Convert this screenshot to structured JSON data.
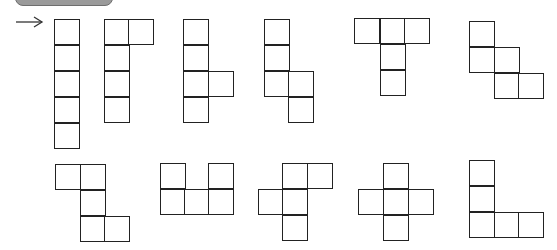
{
  "header": {
    "label": ""
  },
  "arrow": {
    "icon": "right-arrow-icon",
    "glyph": "→"
  },
  "cell_size": 25,
  "shapes": [
    {
      "id": "net-1",
      "cells": [
        [
          54,
          19
        ],
        [
          54,
          45
        ],
        [
          54,
          71
        ],
        [
          54,
          97
        ],
        [
          54,
          123
        ]
      ]
    },
    {
      "id": "net-2",
      "cells": [
        [
          104,
          19
        ],
        [
          128,
          19
        ],
        [
          104,
          45
        ],
        [
          104,
          71
        ],
        [
          104,
          97
        ]
      ]
    },
    {
      "id": "net-3",
      "cells": [
        [
          183,
          19
        ],
        [
          183,
          45
        ],
        [
          183,
          71
        ],
        [
          208,
          71
        ],
        [
          183,
          97
        ]
      ]
    },
    {
      "id": "net-4",
      "cells": [
        [
          264,
          19
        ],
        [
          264,
          45
        ],
        [
          264,
          71
        ],
        [
          288,
          71
        ],
        [
          288,
          97
        ]
      ]
    },
    {
      "id": "net-5",
      "cells": [
        [
          354,
          18
        ],
        [
          380,
          18
        ],
        [
          404,
          18
        ],
        [
          380,
          44
        ],
        [
          380,
          70
        ]
      ]
    },
    {
      "id": "net-6",
      "cells": [
        [
          469,
          21
        ],
        [
          469,
          47
        ],
        [
          494,
          47
        ],
        [
          494,
          73
        ],
        [
          518,
          73
        ]
      ]
    },
    {
      "id": "net-7",
      "cells": [
        [
          55,
          164
        ],
        [
          80,
          164
        ],
        [
          80,
          190
        ],
        [
          80,
          216
        ],
        [
          104,
          216
        ]
      ]
    },
    {
      "id": "net-8",
      "cells": [
        [
          160,
          163
        ],
        [
          208,
          163
        ],
        [
          160,
          189
        ],
        [
          184,
          189
        ],
        [
          208,
          189
        ]
      ]
    },
    {
      "id": "net-9",
      "cells": [
        [
          282,
          163
        ],
        [
          307,
          163
        ],
        [
          258,
          189
        ],
        [
          282,
          189
        ],
        [
          282,
          215
        ]
      ]
    },
    {
      "id": "net-10",
      "cells": [
        [
          383,
          163
        ],
        [
          358,
          189
        ],
        [
          383,
          189
        ],
        [
          408,
          189
        ],
        [
          383,
          215
        ]
      ]
    },
    {
      "id": "net-11",
      "cells": [
        [
          469,
          160
        ],
        [
          469,
          186
        ],
        [
          469,
          212
        ],
        [
          494,
          212
        ],
        [
          518,
          212
        ]
      ]
    }
  ]
}
